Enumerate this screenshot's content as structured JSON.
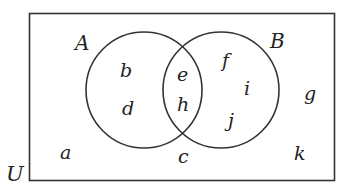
{
  "diagram": {
    "type": "venn",
    "universe_label": "U",
    "sets": [
      {
        "label": "A",
        "elements_only": [
          "b",
          "d"
        ]
      },
      {
        "label": "B",
        "elements_only": [
          "f",
          "i",
          "j"
        ]
      }
    ],
    "intersection": [
      "e",
      "h"
    ],
    "outside": [
      "a",
      "c",
      "g",
      "k"
    ],
    "labels": {
      "U": "U",
      "A": "A",
      "B": "B",
      "a": "a",
      "b": "b",
      "c": "c",
      "d": "d",
      "e": "e",
      "f": "f",
      "g": "g",
      "h": "h",
      "i": "i",
      "j": "j",
      "k": "k"
    }
  }
}
